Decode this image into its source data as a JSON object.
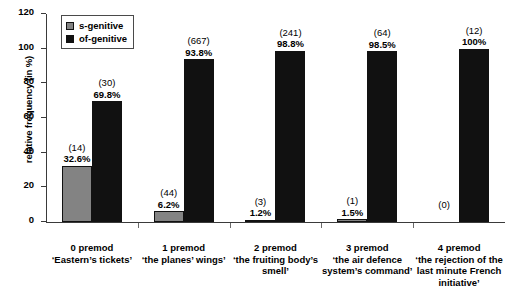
{
  "chart_data": {
    "type": "bar",
    "title": "",
    "xlabel": "",
    "ylabel": "relative frequency (in %)",
    "ylim": [
      0,
      120
    ],
    "ytick_labels": [
      "0",
      "20",
      "40",
      "60",
      "80",
      "100",
      "120"
    ],
    "ytick_values": [
      0,
      20,
      40,
      60,
      80,
      100,
      120
    ],
    "grid": false,
    "legend_position": "top-left",
    "categories": [
      "0 premod",
      "1 premod",
      "2 premod",
      "3 premod",
      "4 premod"
    ],
    "category_examples": [
      "‘Eastern’s tickets’",
      "‘the planes’ wings’",
      "‘the fruiting body’s smell’",
      "‘the air defence system’s command’",
      "‘the rejection of the last minute French initiative’"
    ],
    "series": [
      {
        "name": "s-genitive",
        "color": "#838383",
        "values": [
          32.6,
          6.2,
          1.2,
          1.5,
          0
        ],
        "counts": [
          14,
          44,
          3,
          1,
          0
        ],
        "value_labels": [
          "32.6%",
          "6.2%",
          "1.2%",
          "1.5%",
          ""
        ],
        "count_labels": [
          "(14)",
          "(44)",
          "(3)",
          "(1)",
          "(0)"
        ]
      },
      {
        "name": "of-genitive",
        "color": "#111111",
        "values": [
          69.8,
          93.8,
          98.8,
          98.5,
          100
        ],
        "counts": [
          30,
          667,
          241,
          64,
          12
        ],
        "value_labels": [
          "69.8%",
          "93.8%",
          "98.8%",
          "98.5%",
          "100%"
        ],
        "count_labels": [
          "(30)",
          "(667)",
          "(241)",
          "(64)",
          "(12)"
        ]
      }
    ]
  },
  "legend": {
    "items": [
      {
        "label": "s-genitive",
        "color": "#838383"
      },
      {
        "label": "of-genitive",
        "color": "#111111"
      }
    ]
  },
  "axis": {
    "y_title": "relative frequency (in %)"
  }
}
